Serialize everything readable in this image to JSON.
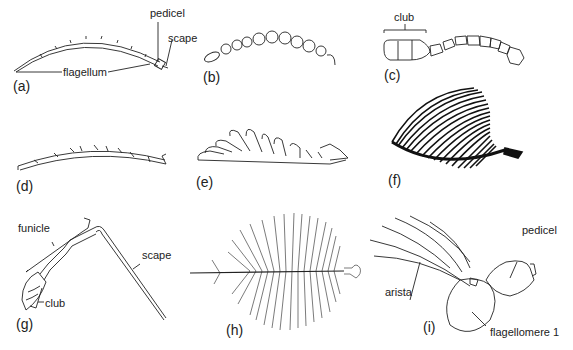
{
  "figure": {
    "panels": [
      {
        "id": "a",
        "label": "(a)",
        "annotations": [
          "pedicel",
          "scape",
          "flagellum"
        ]
      },
      {
        "id": "b",
        "label": "(b)",
        "annotations": []
      },
      {
        "id": "c",
        "label": "(c)",
        "annotations": [
          "club"
        ]
      },
      {
        "id": "d",
        "label": "(d)",
        "annotations": []
      },
      {
        "id": "e",
        "label": "(e)",
        "annotations": []
      },
      {
        "id": "f",
        "label": "(f)",
        "annotations": []
      },
      {
        "id": "g",
        "label": "(g)",
        "annotations": [
          "funicle",
          "scape",
          "club"
        ]
      },
      {
        "id": "h",
        "label": "(h)",
        "annotations": []
      },
      {
        "id": "i",
        "label": "(i)",
        "annotations": [
          "pedicel",
          "arista",
          "flagellomere 1"
        ]
      }
    ]
  },
  "colors": {
    "ink": "#1a1a1a",
    "background": "#ffffff"
  }
}
